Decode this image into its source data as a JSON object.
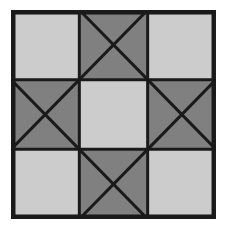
{
  "figure": {
    "kind": "quilt-block-diagram",
    "canvas": {
      "width": 225,
      "height": 235,
      "background": "#ffffff"
    },
    "frame": {
      "x": 11,
      "y": 10,
      "width": 205,
      "height": 209
    }
  },
  "palette": {
    "background": "#ffffff",
    "light_fill": "#cccccc",
    "dark_fill": "#808080",
    "line": "#1a1a1a",
    "border": "#1a1a1a"
  },
  "geometry": {
    "grid_rows": 3,
    "grid_cols": 3,
    "outer_border_width": 4.5,
    "grid_line_width": 3.0,
    "diagonal_line_width": 3.0,
    "col_fractions": [
      0.3333,
      0.3333,
      0.3334
    ],
    "row_fractions": [
      0.3333,
      0.3333,
      0.3334
    ]
  },
  "cells": [
    {
      "id": "cell-r1c1",
      "row": 1,
      "col": 1,
      "position": "top-left",
      "fill": "light",
      "pattern": "plain",
      "label": "Top left plain light square"
    },
    {
      "id": "cell-r1c2",
      "row": 1,
      "col": 2,
      "position": "top-center",
      "fill": "dark",
      "pattern": "x-cross",
      "label": "Top center dark square with X diagonals"
    },
    {
      "id": "cell-r1c3",
      "row": 1,
      "col": 3,
      "position": "top-right",
      "fill": "light",
      "pattern": "plain",
      "label": "Top right plain light square"
    },
    {
      "id": "cell-r2c1",
      "row": 2,
      "col": 1,
      "position": "middle-left",
      "fill": "dark",
      "pattern": "x-cross",
      "label": "Middle left dark square with X diagonals"
    },
    {
      "id": "cell-r2c2",
      "row": 2,
      "col": 2,
      "position": "center",
      "fill": "light",
      "pattern": "plain",
      "label": "Center plain light square"
    },
    {
      "id": "cell-r2c3",
      "row": 2,
      "col": 3,
      "position": "middle-right",
      "fill": "dark",
      "pattern": "x-cross",
      "label": "Middle right dark square with X diagonals"
    },
    {
      "id": "cell-r3c1",
      "row": 3,
      "col": 1,
      "position": "bottom-left",
      "fill": "light",
      "pattern": "plain",
      "label": "Bottom left plain light square"
    },
    {
      "id": "cell-r3c2",
      "row": 3,
      "col": 2,
      "position": "bottom-center",
      "fill": "dark",
      "pattern": "x-cross",
      "label": "Bottom center dark square with X diagonals"
    },
    {
      "id": "cell-r3c3",
      "row": 3,
      "col": 3,
      "position": "bottom-right",
      "fill": "light",
      "pattern": "plain",
      "label": "Bottom right plain light square"
    }
  ]
}
